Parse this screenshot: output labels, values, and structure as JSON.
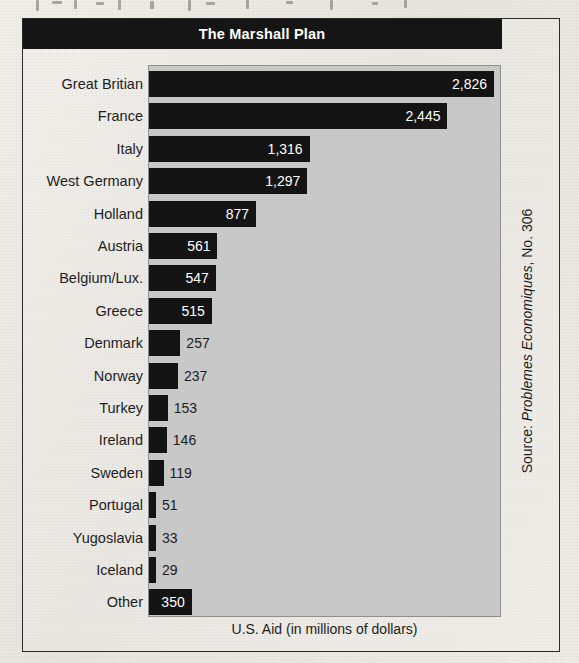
{
  "figure": {
    "title": "The Marshall Plan",
    "x_axis_label": "U.S. Aid (in millions of dollars)",
    "source_prefix": "Source: ",
    "source_italic": "Problemes Economiques",
    "source_suffix": ", No. 306"
  },
  "colors": {
    "title_bar": "#151515",
    "title_text": "#ffffff",
    "plot_background": "#c8c8c8",
    "bar": "#141414",
    "value_inside_text": "#ffffff",
    "value_outside_text": "#1d1d1d",
    "page_background": "#edeae4",
    "frame_border": "#2b2b2b"
  },
  "chart_data": {
    "type": "bar",
    "orientation": "horizontal",
    "title": "The Marshall Plan",
    "xlabel": "U.S. Aid (in millions of dollars)",
    "ylabel": "",
    "xlim": [
      0,
      2826
    ],
    "grid": false,
    "legend": "none",
    "source": "Source: Problemes Economiques, No. 306",
    "categories": [
      "Great Britian",
      "France",
      "Italy",
      "West Germany",
      "Holland",
      "Austria",
      "Belgium/Lux.",
      "Greece",
      "Denmark",
      "Norway",
      "Turkey",
      "Ireland",
      "Sweden",
      "Portugal",
      "Yugoslavia",
      "Iceland",
      "Other"
    ],
    "values": [
      2826,
      2445,
      1316,
      1297,
      877,
      561,
      547,
      515,
      257,
      237,
      153,
      146,
      119,
      51,
      33,
      29,
      350
    ],
    "value_labels": [
      "2,826",
      "2,445",
      "1,316",
      "1,297",
      "877",
      "561",
      "547",
      "515",
      "257",
      "237",
      "153",
      "146",
      "119",
      "51",
      "33",
      "29",
      "350"
    ]
  },
  "artifacts": [
    {
      "left": 36,
      "top": 0,
      "width": 3,
      "height": 11
    },
    {
      "left": 52,
      "top": 1,
      "width": 10,
      "height": 3
    },
    {
      "left": 74,
      "top": 0,
      "width": 3,
      "height": 9
    },
    {
      "left": 96,
      "top": 2,
      "width": 8,
      "height": 3
    },
    {
      "left": 118,
      "top": 0,
      "width": 3,
      "height": 10
    },
    {
      "left": 150,
      "top": 1,
      "width": 4,
      "height": 8
    },
    {
      "left": 188,
      "top": 0,
      "width": 3,
      "height": 11
    },
    {
      "left": 206,
      "top": 2,
      "width": 9,
      "height": 3
    },
    {
      "left": 246,
      "top": 0,
      "width": 3,
      "height": 9
    },
    {
      "left": 286,
      "top": 1,
      "width": 7,
      "height": 3
    },
    {
      "left": 330,
      "top": 0,
      "width": 3,
      "height": 10
    },
    {
      "left": 372,
      "top": 2,
      "width": 6,
      "height": 3
    },
    {
      "left": 404,
      "top": 0,
      "width": 3,
      "height": 8
    }
  ]
}
